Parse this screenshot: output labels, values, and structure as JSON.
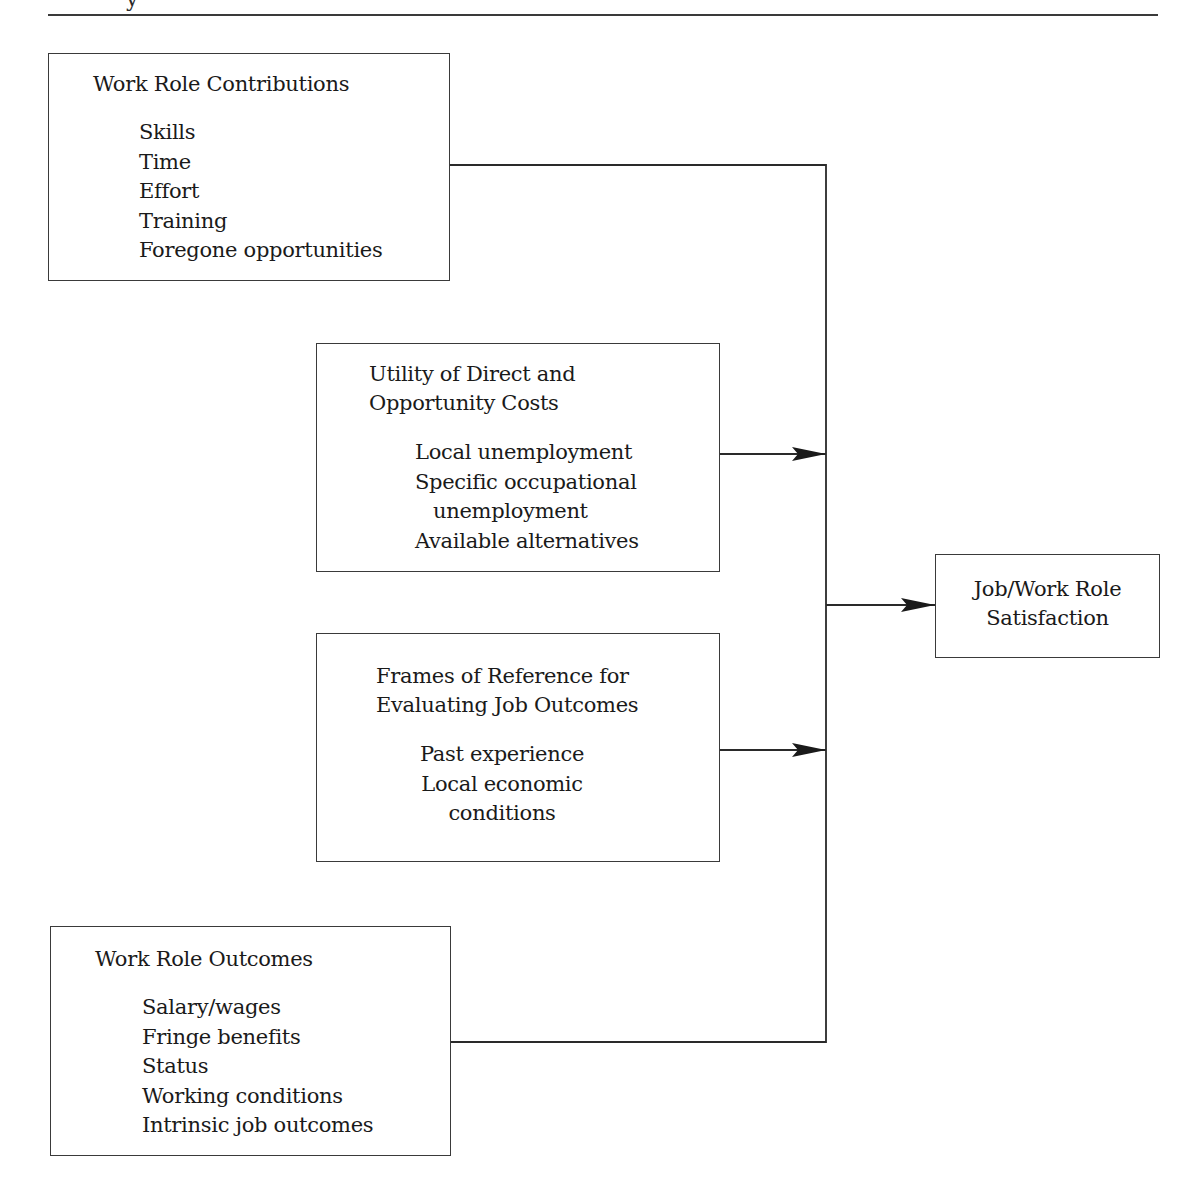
{
  "page": {
    "header_fragment": "y"
  },
  "diagram": {
    "boxes": {
      "contributions": {
        "title": "Work Role Contributions",
        "items": [
          "Skills",
          "Time",
          "Effort",
          "Training",
          "Foregone opportunities"
        ]
      },
      "costs": {
        "title_lines": [
          "Utility of Direct and",
          "Opportunity Costs"
        ],
        "items": [
          "Local unemployment",
          "Specific occupational",
          "unemployment",
          "Available alternatives"
        ]
      },
      "frames": {
        "title_lines": [
          "Frames of Reference for",
          "Evaluating Job Outcomes"
        ],
        "items": [
          "Past experience",
          "Local economic",
          "conditions"
        ]
      },
      "outcomes": {
        "title": "Work Role Outcomes",
        "items": [
          "Salary/wages",
          "Fringe benefits",
          "Status",
          "Working conditions",
          "Intrinsic job outcomes"
        ]
      },
      "satisfaction": {
        "title_lines": [
          "Job/Work Role",
          "Satisfaction"
        ]
      }
    },
    "edges": [
      {
        "from": "Work Role Contributions",
        "to": "Job/Work Role Satisfaction",
        "type": "line-to-bus"
      },
      {
        "from": "Utility of Direct and Opportunity Costs",
        "to": "bus",
        "type": "arrow"
      },
      {
        "from": "Frames of Reference for Evaluating Job Outcomes",
        "to": "bus",
        "type": "arrow"
      },
      {
        "from": "Work Role Outcomes",
        "to": "Job/Work Role Satisfaction",
        "type": "line-to-bus"
      },
      {
        "from": "bus",
        "to": "Job/Work Role Satisfaction",
        "type": "arrow"
      }
    ],
    "colors": {
      "line": "#2a2a2a",
      "text": "#1a1a1a",
      "background": "#ffffff"
    }
  }
}
